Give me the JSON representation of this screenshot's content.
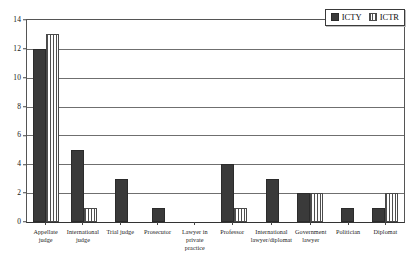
{
  "chart_data": {
    "type": "bar",
    "title": "",
    "xlabel": "",
    "ylabel": "",
    "ylim": [
      0,
      14
    ],
    "yticks": [
      0,
      2,
      4,
      6,
      8,
      10,
      12,
      14
    ],
    "grid": true,
    "legend_position": "top-right",
    "categories": [
      "Appellate\njudge",
      "International\njudge",
      "Trial judge",
      "Prosecutor",
      "Lawyer in\nprivate practice",
      "Professor",
      "International\nlawyer/diplomat",
      "Government\nlawyer",
      "Politician",
      "Diplomat"
    ],
    "series": [
      {
        "name": "ICTY",
        "pattern": "solid",
        "color": "#3a3a3a",
        "values": [
          12,
          5,
          3,
          1,
          0,
          4,
          3,
          2,
          1,
          1
        ]
      },
      {
        "name": "ICTR",
        "pattern": "vertical-stripes",
        "color": "#4f4f4f",
        "values": [
          13,
          1,
          0,
          0,
          0,
          1,
          0,
          2,
          0,
          2
        ]
      }
    ]
  }
}
